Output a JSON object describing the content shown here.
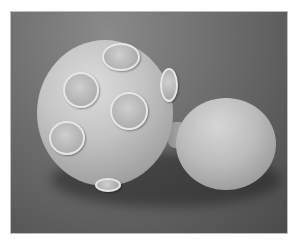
{
  "image": {
    "subject": "Scanning electron micrograph of a budding yeast cell with bud scars",
    "background_color": "#6d6d6d",
    "border_color": "#bdbdbd",
    "elements": [
      {
        "name": "mother-cell",
        "bud_scars": 6
      },
      {
        "name": "daughter-bud"
      }
    ]
  }
}
